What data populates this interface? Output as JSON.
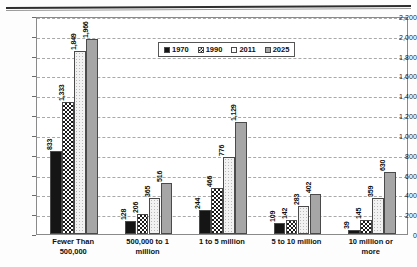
{
  "chart_data": {
    "type": "bar",
    "title": "",
    "xlabel": "",
    "ylabel": "",
    "ylim": [
      0,
      2200
    ],
    "ytick_step": 200,
    "grid": true,
    "legend_position": "top-center",
    "categories": [
      "Fewer Than 500,000",
      "500,000 to 1 million",
      "1 to 5 million",
      "5 to 10 million",
      "10 million or more"
    ],
    "series": [
      {
        "name": "1970",
        "values": [
          833,
          128,
          244,
          109,
          39
        ]
      },
      {
        "name": "1990",
        "values": [
          1333,
          206,
          466,
          142,
          145
        ]
      },
      {
        "name": "2011",
        "values": [
          1849,
          365,
          776,
          283,
          359
        ]
      },
      {
        "name": "2025",
        "values": [
          1966,
          516,
          1129,
          402,
          630
        ]
      }
    ],
    "value_labels": [
      [
        "833",
        "1,333",
        "1,849",
        "1,966"
      ],
      [
        "128",
        "206",
        "365",
        "516"
      ],
      [
        "244",
        "466",
        "776",
        "1,129"
      ],
      [
        "109",
        "142",
        "283",
        "402"
      ],
      [
        "39",
        "145",
        "359",
        "630"
      ]
    ],
    "ytick_labels": [
      "0",
      "200",
      "400",
      "600",
      "800",
      "1,000",
      "1,200",
      "1,400",
      "1,600",
      "1,800",
      "2,000",
      "2,200"
    ],
    "category_label_lines": [
      [
        "Fewer Than",
        "500,000"
      ],
      [
        "500,000 to 1",
        "million"
      ],
      [
        "1 to 5 million",
        ""
      ],
      [
        "5 to 10 million",
        ""
      ],
      [
        "10 million or",
        "more"
      ]
    ],
    "colors": {
      "series_1970": "#151515",
      "series_1990": "#ffffff",
      "series_2011": "#f2f2f2",
      "series_2025": "#a6a6a6",
      "gridline": "#a9a9a9",
      "frame": "#8a8a8a",
      "text": "#101010"
    }
  },
  "legend": {
    "items": [
      {
        "label": "1970"
      },
      {
        "label": "1990"
      },
      {
        "label": "2011"
      },
      {
        "label": "2025"
      }
    ]
  }
}
